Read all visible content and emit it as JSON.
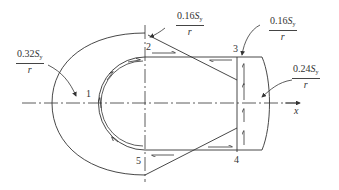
{
  "diagram": {
    "type": "shear-flow cross-section diagram",
    "stroke_color": "#333333",
    "background": "#ffffff",
    "axis": {
      "label": "x"
    },
    "points": [
      {
        "id": "p1",
        "label": "1"
      },
      {
        "id": "p2",
        "label": "2"
      },
      {
        "id": "p3",
        "label": "3"
      },
      {
        "id": "p4",
        "label": "4"
      },
      {
        "id": "p5",
        "label": "5"
      }
    ],
    "annotations": {
      "left": {
        "coef": "0.32",
        "symbol": "S",
        "sub": "y",
        "den": "r"
      },
      "top_mid": {
        "coef": "0.16",
        "symbol": "S",
        "sub": "y",
        "den": "r"
      },
      "top_right": {
        "coef": "0.16",
        "symbol": "S",
        "sub": "y",
        "den": "r"
      },
      "right": {
        "coef": "0.24",
        "symbol": "S",
        "sub": "y",
        "den": "r"
      }
    }
  }
}
